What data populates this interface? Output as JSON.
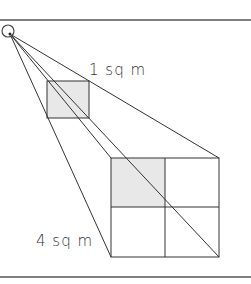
{
  "labels": {
    "small_square": "1 sq m",
    "large_square": "4 sq m"
  },
  "colors": {
    "line": "#333333",
    "shade": "#e6e6e6",
    "border": "#555555"
  },
  "geometry": {
    "apex": {
      "x": 9,
      "y": 33,
      "r": 6
    },
    "small_square": {
      "x": 47,
      "y": 81,
      "w": 42,
      "h": 37
    },
    "large_square": {
      "x": 111,
      "y": 158,
      "w": 108,
      "h": 99,
      "cells": 4,
      "shaded_cell": "top-left"
    },
    "border_top_y": 20,
    "border_bottom_y": 277
  }
}
